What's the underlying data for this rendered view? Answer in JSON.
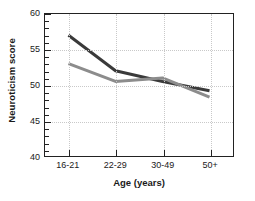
{
  "chart_data": {
    "type": "line",
    "title": "",
    "xlabel": "Age (years)",
    "ylabel": "Neuroticism score",
    "categories": [
      "16-21",
      "22-29",
      "30-49",
      "50+"
    ],
    "ylim": [
      40,
      60
    ],
    "yticks": [
      40,
      45,
      50,
      55,
      60
    ],
    "ytick_labels": [
      "40",
      "45",
      "50",
      "55",
      "60"
    ],
    "yminor_step": 1,
    "grid": true,
    "grid_style": "dotted",
    "legend": "none",
    "series": [
      {
        "name": "dark-series",
        "color": "#3a3a3a",
        "values": [
          57.0,
          52.0,
          50.5,
          49.2
        ]
      },
      {
        "name": "gray-series",
        "color": "#8c8c8c",
        "values": [
          53.0,
          50.5,
          51.0,
          48.3
        ]
      }
    ]
  },
  "axes": {
    "frame_color": "#222222",
    "tick_color": "#222222",
    "grid_color": "#c9c9c9"
  }
}
